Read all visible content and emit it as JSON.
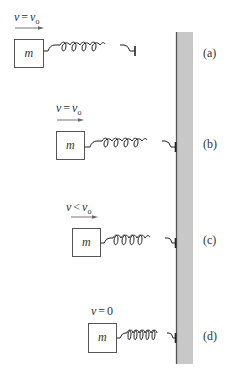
{
  "diagram": {
    "wall": {
      "color": "#c8c8c8",
      "edge_color": "#555555"
    },
    "scenes": [
      {
        "id": "a",
        "panel_label": "(a)",
        "velocity_label": {
          "v": "v",
          "rel": "=",
          "rhs": "v",
          "sub": "o"
        },
        "mass_label": "m",
        "show_arrow": true
      },
      {
        "id": "b",
        "panel_label": "(b)",
        "velocity_label": {
          "v": "v",
          "rel": "=",
          "rhs": "v",
          "sub": "o"
        },
        "mass_label": "m",
        "show_arrow": true
      },
      {
        "id": "c",
        "panel_label": "(c)",
        "velocity_label": {
          "v": "v",
          "rel": "<",
          "rhs": "v",
          "sub": "o"
        },
        "mass_label": "m",
        "show_arrow": true
      },
      {
        "id": "d",
        "panel_label": "(d)",
        "velocity_label": {
          "v": "v",
          "rel": "=",
          "rhs": "0",
          "sub": ""
        },
        "mass_label": "m",
        "show_arrow": false
      }
    ]
  }
}
